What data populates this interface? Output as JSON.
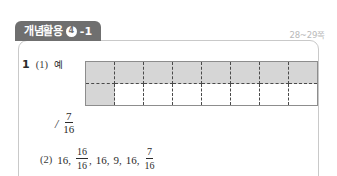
{
  "section_tab": {
    "title": "개념활용",
    "circled_number": "4",
    "suffix": "-1",
    "bg_color": "#6f6f6f",
    "text_color": "#ffffff"
  },
  "page_reference": "28~29쪽",
  "problem": {
    "number": "1",
    "sub_label_1": "(1)",
    "example_mark": "예",
    "sub_label_2": "(2)"
  },
  "grid": {
    "columns": 8,
    "rows": 2,
    "total_cells": 16,
    "shaded_cells": 9,
    "shaded_color": "#d6d6d6",
    "cell_color": "#ffffff",
    "border_color": "#8d8d8d",
    "inner_line_color": "#4a4a4a",
    "cells": [
      [
        "shaded",
        "shaded",
        "shaded",
        "shaded",
        "shaded",
        "shaded",
        "shaded",
        "shaded"
      ],
      [
        "shaded",
        "empty",
        "empty",
        "empty",
        "empty",
        "empty",
        "empty",
        "empty"
      ]
    ]
  },
  "answer_1": {
    "slash": "/",
    "fraction": {
      "numerator": "7",
      "denominator": "16"
    }
  },
  "answer_2": {
    "items": [
      {
        "type": "number",
        "value": "16"
      },
      {
        "type": "fraction",
        "numerator": "16",
        "denominator": "16"
      },
      {
        "type": "number",
        "value": "16"
      },
      {
        "type": "number",
        "value": "9"
      },
      {
        "type": "number",
        "value": "16"
      },
      {
        "type": "fraction",
        "numerator": "7",
        "denominator": "16"
      }
    ],
    "separator": ","
  }
}
